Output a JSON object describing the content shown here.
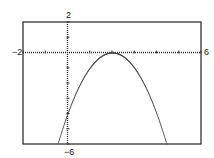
{
  "chart_data": {
    "type": "line",
    "title": "",
    "xlabel": "",
    "ylabel": "",
    "xlim": [
      -2,
      6
    ],
    "ylim": [
      -6,
      2
    ],
    "x_tick_step": 1,
    "y_tick_step": 1,
    "grid": false,
    "legend": null,
    "function": "y = -(x - 2)^2",
    "series": [
      {
        "name": "f(x)",
        "style": "dotted",
        "x": [
          -0.45,
          0,
          0.5,
          1,
          1.5,
          2,
          2.5,
          3,
          3.5,
          4,
          4.45
        ],
        "y": [
          -6,
          -4,
          -2.25,
          -1,
          -0.25,
          0,
          -0.25,
          -1,
          -2.25,
          -4,
          -6
        ]
      }
    ]
  },
  "labels": {
    "xmin": "−2",
    "xmax": "6",
    "ymax": "2",
    "ymin": "−6"
  },
  "colors": {
    "axis": "#333333",
    "curve": "#444444",
    "frame": "#333333"
  }
}
